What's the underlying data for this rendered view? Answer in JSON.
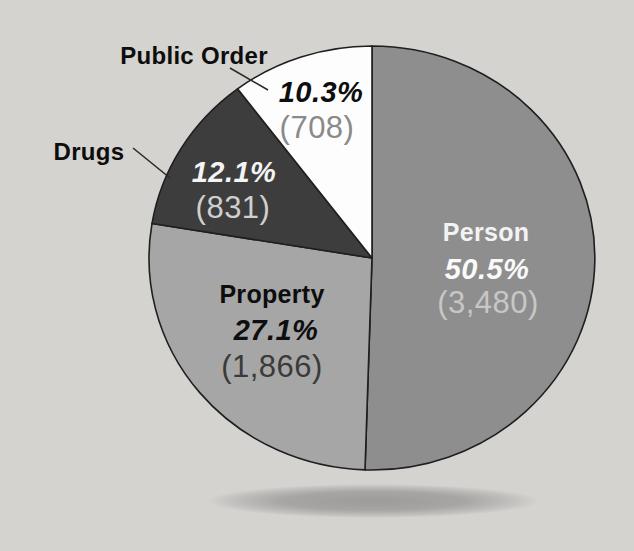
{
  "background_color": "#d5d3d0",
  "chart_data": {
    "type": "pie",
    "title": "",
    "direction": "clockwise",
    "start_angle_deg": 0,
    "legend_position": "none",
    "labels_inside": true,
    "outline_color": "#1f1f1f",
    "slices": [
      {
        "id": "person",
        "label": "Person",
        "pct": 50.5,
        "pct_label": "50.5%",
        "value": 3480,
        "count_label": "(3,480)",
        "color": "#8e8e8e",
        "label_placement": "inside"
      },
      {
        "id": "property",
        "label": "Property",
        "pct": 27.1,
        "pct_label": "27.1%",
        "value": 1866,
        "count_label": "(1,866)",
        "color": "#a6a6a6",
        "label_placement": "inside"
      },
      {
        "id": "drugs",
        "label": "Drugs",
        "pct": 12.1,
        "pct_label": "12.1%",
        "value": 831,
        "count_label": "(831)",
        "color": "#3d3d3d",
        "label_placement": "outside-with-leader-line"
      },
      {
        "id": "public_order",
        "label": "Public Order",
        "pct": 10.3,
        "pct_label": "10.3%",
        "value": 708,
        "count_label": "(708)",
        "color": "#fdfdfd",
        "label_placement": "outside-with-leader-line"
      }
    ]
  }
}
